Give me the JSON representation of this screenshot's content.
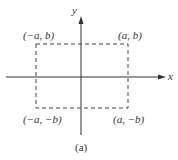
{
  "diagram": {
    "axes": {
      "x_label": "x",
      "y_label": "y"
    },
    "corners": {
      "top_left": "(−a, b)",
      "top_right": "(a, b)",
      "bottom_left": "(−a, −b)",
      "bottom_right": "(a, −b)"
    },
    "caption": "(a)",
    "colors": {
      "line": "#333333",
      "dashed": "#444444"
    }
  }
}
